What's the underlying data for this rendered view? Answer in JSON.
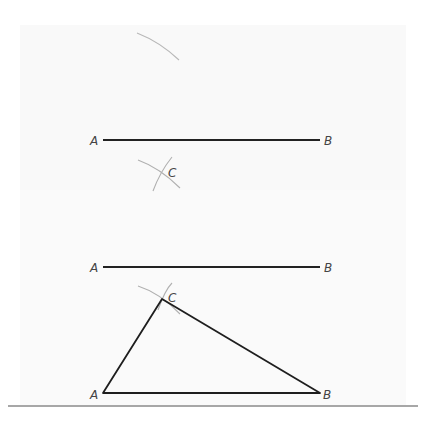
{
  "figure": {
    "colors": {
      "segment": "#222222",
      "arc": "#b0b0b0",
      "label": "#444444",
      "rule": "#8a8a8a"
    },
    "step1": {
      "segment": {
        "start_label": "A",
        "end_label": "B"
      },
      "intersection_label": "C"
    },
    "step2": {
      "segment": {
        "start_label": "A",
        "end_label": "B"
      },
      "triangle": {
        "vertices": [
          "A",
          "B",
          "C"
        ],
        "labels": {
          "a": "A",
          "b": "B",
          "c": "C"
        }
      }
    }
  }
}
